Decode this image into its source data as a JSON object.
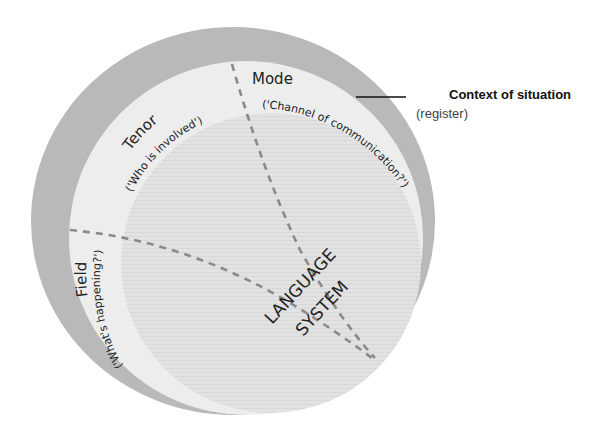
{
  "diagram": {
    "context": {
      "title": "Context of situation",
      "subtitle": "(register)"
    },
    "mode": {
      "label": "Mode",
      "description": "('Channel of communication?')"
    },
    "tenor": {
      "label": "Tenor",
      "description": "('Who is involved')"
    },
    "field": {
      "label": "Field",
      "description": "('What's happening?')"
    },
    "core": {
      "line1": "LANGUAGE",
      "line2": "SYSTEM"
    },
    "colors": {
      "outer_ring": "#b9b9b9",
      "middle_ring": "#ededed",
      "inner_circle": "#e1e1e1",
      "dashed_line": "#8a8a8a",
      "pointer_line": "#111111"
    }
  }
}
